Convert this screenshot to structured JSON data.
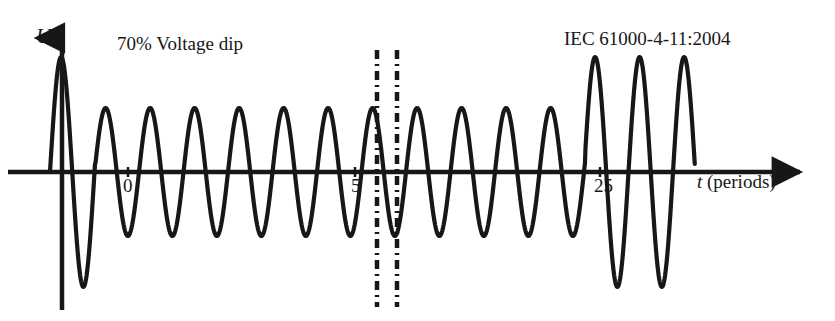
{
  "figure": {
    "width": 835,
    "height": 321,
    "background": "#ffffff",
    "ink_color": "#171717"
  },
  "annotations": {
    "dip_label": "70% Voltage dip",
    "standard_label": "IEC 61000-4-11:2004"
  },
  "axes": {
    "y_label": "U",
    "x_label_var": "t",
    "x_label_unit": " (periods)",
    "x_label_full": "t (periods)",
    "baseline_y": 172,
    "origin_x": 62,
    "y_axis_top": 32,
    "y_axis_bottom": 310,
    "x_axis_right": 808
  },
  "ticks": {
    "labels": [
      "0",
      "5",
      "25"
    ],
    "positions_px": [
      128,
      355,
      600
    ]
  },
  "break_marks": {
    "style": "dash-dot",
    "x_positions": [
      377,
      397
    ],
    "y_top": 50,
    "y_bottom": 307
  },
  "chart_data": {
    "type": "line",
    "title": "",
    "subtitle": "",
    "xlabel": "t (periods)",
    "ylabel": "U",
    "grid": false,
    "legend": null,
    "xlim": [
      -0.3,
      28
    ],
    "ylim": [
      -1.15,
      1.15
    ],
    "x_tick_labels": [
      "0",
      "5",
      "25"
    ],
    "x_tick_values": [
      0,
      5,
      25
    ],
    "y_tick_labels": [],
    "waveform": {
      "description": "Sinusoidal mains voltage with a 70% voltage dip: one full-amplitude cycle, a long dipped interval at reduced amplitude, then recovery to full amplitude for the last two cycles.",
      "nominal_amplitude": 1.0,
      "dip_residual_amplitude": 0.58,
      "dip_percent_label": "70%",
      "period_px": 44.5,
      "samples_per_period": 90,
      "start_x_px": 50,
      "end_x_px": 695,
      "full_amplitude_px": 115,
      "dip_amplitude_px": 64,
      "segments": [
        {
          "name": "pre-dip-nominal",
          "x_start_px": 50,
          "x_end_px": 95,
          "amplitude_px": 115
        },
        {
          "name": "dip-interval",
          "x_start_px": 95,
          "x_end_px": 585,
          "amplitude_px": 64
        },
        {
          "name": "post-dip-nominal",
          "x_start_px": 585,
          "x_end_px": 695,
          "amplitude_px": 115
        }
      ]
    },
    "annotations": [
      {
        "text": "70% Voltage dip",
        "x_px": 117,
        "y_px": 34
      },
      {
        "text": "IEC 61000-4-11:2004",
        "x_px": 564,
        "y_px": 29
      }
    ]
  }
}
